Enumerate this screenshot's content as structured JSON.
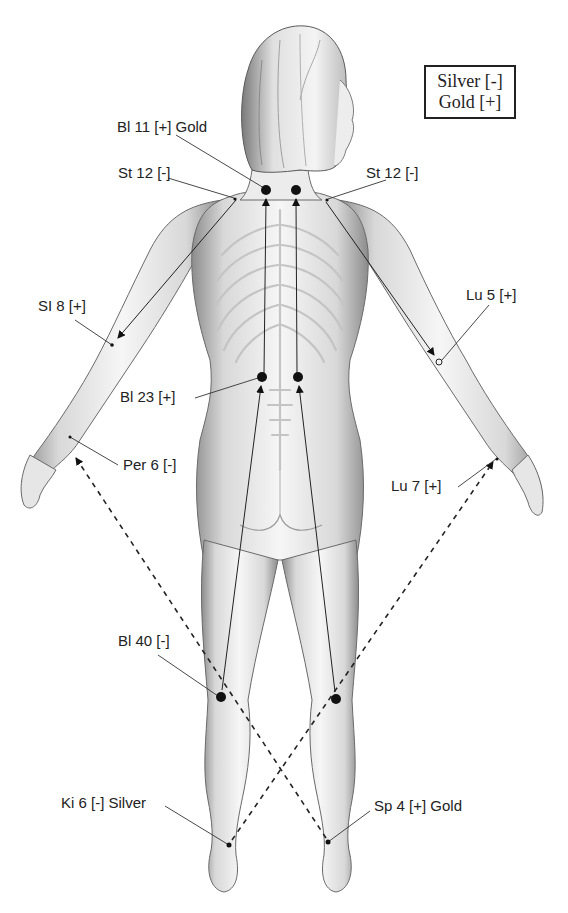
{
  "legend": {
    "silver": "Silver [-]",
    "gold": "Gold [+]"
  },
  "points": [
    {
      "id": "bl11",
      "label": "Bl 11 [+] Gold",
      "polarity": "+",
      "metal": "Gold"
    },
    {
      "id": "st12_left",
      "label": "St 12 [-]",
      "polarity": "-"
    },
    {
      "id": "st12_right",
      "label": "St 12 [-]",
      "polarity": "-"
    },
    {
      "id": "si8",
      "label": "SI 8 [+]",
      "polarity": "+"
    },
    {
      "id": "lu5",
      "label": "Lu 5 [+]",
      "polarity": "+"
    },
    {
      "id": "bl23",
      "label": "Bl 23 [+]",
      "polarity": "+"
    },
    {
      "id": "per6",
      "label": "Per 6 [-]",
      "polarity": "-"
    },
    {
      "id": "lu7",
      "label": "Lu 7 [+]",
      "polarity": "+"
    },
    {
      "id": "bl40",
      "label": "Bl 40 [-]",
      "polarity": "-"
    },
    {
      "id": "ki6",
      "label": "Ki 6 [-] Silver",
      "polarity": "-",
      "metal": "Silver"
    },
    {
      "id": "sp4",
      "label": "Sp 4 [+] Gold",
      "polarity": "+",
      "metal": "Gold"
    }
  ],
  "connections": [
    {
      "from": "Bl 23",
      "to": "Bl 11",
      "style": "solid"
    },
    {
      "from": "Bl 40",
      "to": "Bl 23",
      "style": "solid"
    },
    {
      "from": "St 12",
      "to": "SI 8",
      "style": "solid"
    },
    {
      "from": "St 12",
      "to": "Lu 5",
      "style": "solid"
    },
    {
      "from": "Sp 4",
      "to": "Per 6",
      "style": "dashed"
    },
    {
      "from": "Ki 6",
      "to": "Lu 7",
      "style": "dashed"
    }
  ],
  "colors": {
    "ink": "#111111",
    "skin_light": "#f2f2f2",
    "skin_shade": "#9a9a9a",
    "background": "#ffffff"
  }
}
